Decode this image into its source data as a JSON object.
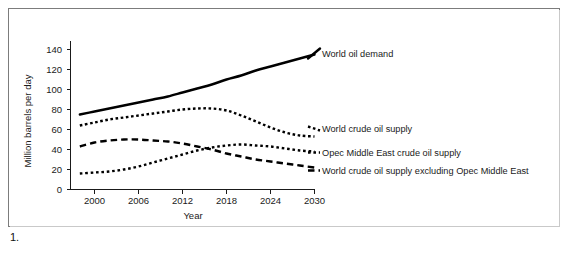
{
  "caption": "1.",
  "chart_data": {
    "type": "line",
    "title": "",
    "xlabel": "Year",
    "ylabel": "Million barrels per day",
    "xlim": [
      1998,
      2031
    ],
    "ylim": [
      0,
      148
    ],
    "xticks": [
      "2000",
      "2006",
      "2012",
      "2018",
      "2024",
      "2030"
    ],
    "xtick_values": [
      2000,
      2006,
      2012,
      2018,
      2024,
      2030
    ],
    "yticks": [
      "0",
      "20",
      "40",
      "60",
      "80",
      "100",
      "120",
      "140"
    ],
    "ytick_values": [
      0,
      20,
      40,
      60,
      80,
      100,
      120,
      140
    ],
    "grid": false,
    "legend": "inline-right-labels",
    "x": [
      1998,
      2000,
      2002,
      2004,
      2006,
      2008,
      2010,
      2012,
      2014,
      2016,
      2018,
      2020,
      2022,
      2024,
      2026,
      2028,
      2030
    ],
    "series": [
      {
        "name": "World oil demand",
        "style": "solid",
        "label": "World oil demand",
        "values": [
          75,
          78,
          81,
          84,
          87,
          90,
          93,
          97,
          101,
          105,
          110,
          114,
          119,
          123,
          127,
          131,
          135
        ]
      },
      {
        "name": "World crude oil supply",
        "style": "dotted-large",
        "label": "World crude oil supply",
        "values": [
          64,
          67,
          70,
          72,
          74,
          76,
          78,
          80,
          81,
          81,
          79,
          74,
          68,
          62,
          57,
          54,
          53
        ]
      },
      {
        "name": "Opec Middle East crude oil supply",
        "style": "dotted-small",
        "label": "Opec Middle East crude oil supply",
        "values": [
          16,
          17,
          18,
          20,
          23,
          27,
          31,
          35,
          39,
          42,
          44,
          45,
          44,
          43,
          41,
          39,
          38
        ]
      },
      {
        "name": "World crude oil supply excluding Opec Middle East",
        "style": "dashed",
        "label": "World crude oil supply excluding Opec Middle East",
        "values": [
          43,
          47,
          49,
          50,
          50,
          49,
          48,
          46,
          43,
          40,
          36,
          33,
          30,
          28,
          26,
          24,
          22
        ]
      }
    ]
  }
}
